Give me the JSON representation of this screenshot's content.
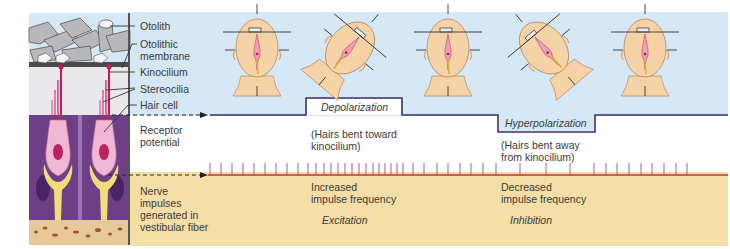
{
  "diagram": {
    "anatomy_labels": {
      "otolith": "Otolith",
      "otolithic_membrane_line1": "Otolithic",
      "otolithic_membrane_line2": "membrane",
      "kinocilium": "Kinocilium",
      "stereocilia": "Stereocilia",
      "hair_cell": "Hair cell"
    },
    "row_labels": {
      "receptor_potential_line1": "Receptor",
      "receptor_potential_line2": "potential",
      "nerve_line1": "Nerve",
      "nerve_line2": "impulses",
      "nerve_line3": "generated in",
      "nerve_line4": "vestibular fiber"
    },
    "states": [
      {
        "box": "Depolarization",
        "note_line1": "(Hairs bent toward",
        "note_line2": "kinocilium)",
        "freq_line1": "Increased",
        "freq_line2": "impulse frequency",
        "effect": "Excitation"
      },
      {
        "box": "Hyperpolarization",
        "note_line1": "(Hairs bent away",
        "note_line2": "from kinocilium)",
        "freq_line1": "Decreased",
        "freq_line2": "impulse frequency",
        "effect": "Inhibition"
      }
    ],
    "head_positions": [
      "upright",
      "tilted toward kinocilium",
      "upright",
      "tilted away from kinocilium",
      "upright"
    ],
    "colors": {
      "sky": "#d6e8f5",
      "tan": "#f5dfa6",
      "potential_line": "#3d2f6e",
      "spike_line": "#c8304a",
      "tissue_purple": "#6e3f86",
      "hair_cell_pink": "#f0b8d4",
      "nerve_yellow": "#f3dd7a",
      "skin": "#f6d3a6"
    }
  }
}
